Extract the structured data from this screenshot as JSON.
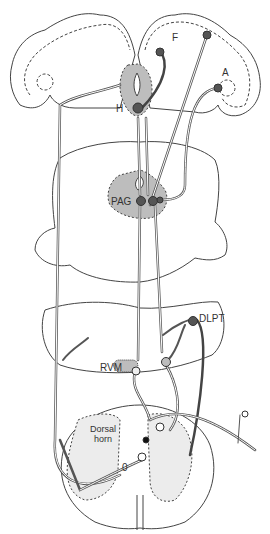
{
  "diagram": {
    "type": "neuroanatomical pathway diagram",
    "colors": {
      "outline": "#444444",
      "gray_matter_fill": "#bdbdbd",
      "dorsal_horn_fill": "#ececec",
      "neuron_dark": "#555555",
      "neuron_light": "#e0e0e0",
      "background": "#ffffff"
    },
    "labels": {
      "frontal": "F",
      "amygdala": "A",
      "hypothalamus": "H",
      "pag": "PAG",
      "dlpt": "DLPT",
      "rvm": "RVM",
      "dorsal_horn_line1": "Dorsal",
      "dorsal_horn_line2": "horn",
      "lamina_zero": "0"
    },
    "levels": [
      "Forebrain",
      "Midbrain",
      "Pons / Medulla",
      "Spinal cord"
    ]
  }
}
